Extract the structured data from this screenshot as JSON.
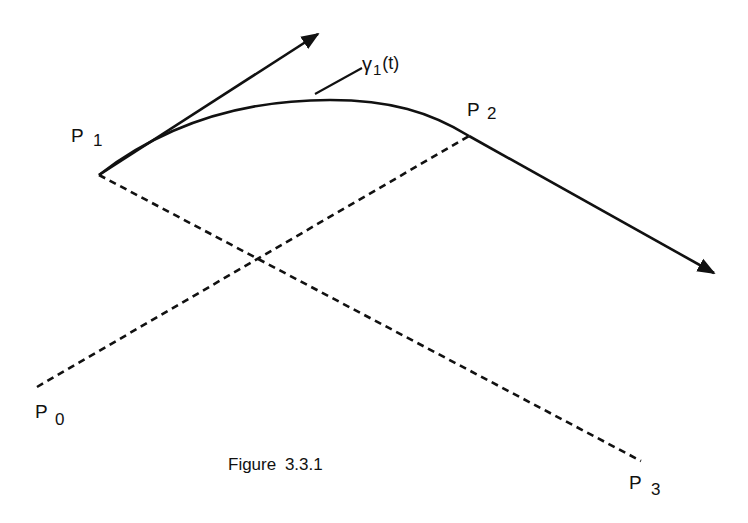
{
  "figure": {
    "caption": "Figure 3.3.1",
    "colors": {
      "ink": "#111111",
      "background": "#ffffff"
    }
  },
  "points": {
    "p0": {
      "letter": "P",
      "sub": "0"
    },
    "p1": {
      "letter": "P",
      "sub": "1"
    },
    "p2": {
      "letter": "P",
      "sub": "2"
    },
    "p3": {
      "letter": "P",
      "sub": "3"
    }
  },
  "curve": {
    "symbol": "γ",
    "sub": "1",
    "arg": "(t)"
  }
}
